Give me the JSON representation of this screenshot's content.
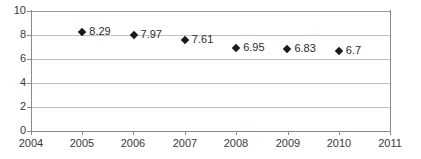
{
  "chart_data": {
    "type": "scatter",
    "title": "",
    "subtitle": "",
    "xlabel": "",
    "ylabel": "",
    "x": [
      2005,
      2006,
      2007,
      2008,
      2009,
      2010
    ],
    "values": [
      8.29,
      7.97,
      7.61,
      6.95,
      6.83,
      6.7
    ],
    "point_labels": [
      "8.29",
      "7.97",
      "7.61",
      "6.95",
      "6.83",
      "6.7"
    ],
    "xlim": [
      2004,
      2011
    ],
    "ylim": [
      0,
      10
    ],
    "x_ticks": [
      2004,
      2005,
      2006,
      2007,
      2008,
      2009,
      2010,
      2011
    ],
    "x_tick_labels": [
      "2004",
      "2005",
      "2006",
      "2007",
      "2008",
      "2009",
      "2010",
      "2011"
    ],
    "y_ticks": [
      0,
      2,
      4,
      6,
      8,
      10
    ],
    "y_tick_labels": [
      "0",
      "2",
      "4",
      "6",
      "8",
      "10"
    ],
    "grid": "horizontal",
    "legend": "none",
    "marker": "diamond",
    "marker_color": "#1a1a1a",
    "grid_color": "#bfbfbf",
    "axis_color": "#8a8a8a",
    "label_color": "#2b2b2b",
    "background": "#ffffff",
    "data_labels_shown": true,
    "data_label_position": "right"
  }
}
